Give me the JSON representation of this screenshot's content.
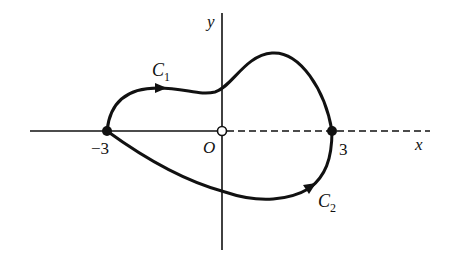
{
  "diagram": {
    "axes": {
      "x_label": "x",
      "y_label": "y",
      "origin_label": "O",
      "x_axis_negative_style": "solid",
      "x_axis_positive_style": "dashed"
    },
    "points": [
      {
        "label": "−3",
        "value": -3,
        "marker": "filled"
      },
      {
        "label": "O",
        "value": 0,
        "marker": "hollow"
      },
      {
        "label": "3",
        "value": 3,
        "marker": "filled"
      }
    ],
    "curves": [
      {
        "name": "C",
        "subscript": "1",
        "from": -3,
        "to": 3,
        "path": "upper",
        "direction": "from -3 to 3"
      },
      {
        "name": "C",
        "subscript": "2",
        "from": -3,
        "to": 3,
        "path": "lower",
        "direction": "from -3 to 3"
      }
    ],
    "colors": {
      "ink": "#111111",
      "background": "#ffffff"
    }
  }
}
